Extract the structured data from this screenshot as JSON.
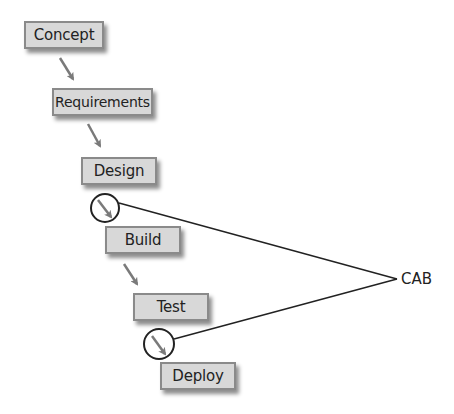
{
  "diagram": {
    "type": "waterfall-process",
    "stages": [
      {
        "id": "concept",
        "label": "Concept"
      },
      {
        "id": "requirements",
        "label": "Requirements"
      },
      {
        "id": "design",
        "label": "Design"
      },
      {
        "id": "build",
        "label": "Build"
      },
      {
        "id": "test",
        "label": "Test"
      },
      {
        "id": "deploy",
        "label": "Deploy"
      }
    ],
    "flow": [
      {
        "from": "concept",
        "to": "requirements"
      },
      {
        "from": "requirements",
        "to": "design"
      },
      {
        "from": "design",
        "to": "build",
        "highlighted": true
      },
      {
        "from": "build",
        "to": "test"
      },
      {
        "from": "test",
        "to": "deploy",
        "highlighted": true
      }
    ],
    "review_node": {
      "label": "CAB"
    },
    "review_links": [
      {
        "from_transition": "design-build",
        "to": "CAB"
      },
      {
        "from_transition": "test-deploy",
        "to": "CAB"
      }
    ],
    "colors": {
      "box_fill": "#d8d8d8",
      "box_border": "#8a8a8a",
      "arrow": "#7a7a7a",
      "line": "#222222",
      "text": "#222222"
    }
  }
}
